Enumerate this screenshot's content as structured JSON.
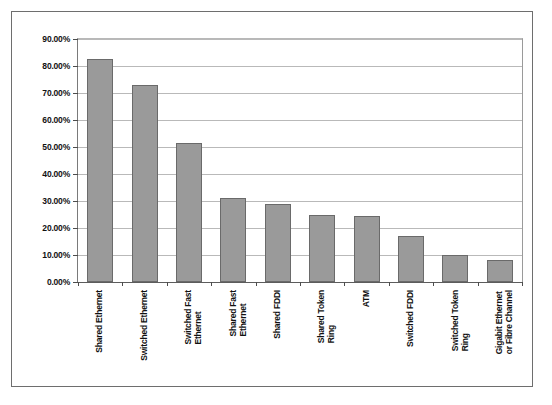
{
  "chart_data": {
    "type": "bar",
    "title": "",
    "subtitle": "",
    "xlabel": "",
    "ylabel": "",
    "ylim": [
      0,
      90
    ],
    "grid": true,
    "legend": false,
    "y_ticks": [
      "0.00%",
      "10.00%",
      "20.00%",
      "30.00%",
      "40.00%",
      "50.00%",
      "60.00%",
      "70.00%",
      "80.00%",
      "90.00%"
    ],
    "y_tick_values": [
      0,
      10,
      20,
      30,
      40,
      50,
      60,
      70,
      80,
      90
    ],
    "categories": [
      "Shared Ethernet",
      "Switched Ethernet",
      "Switched Fast Ethernet",
      "Shared Fast Ethernet",
      "Shared FDDI",
      "Shared Token Ring",
      "ATM",
      "Switched FDDI",
      "Switched Token Ring",
      "Gigabit Ethernet or Fibre Channel"
    ],
    "category_lines": [
      [
        "Shared Ethernet"
      ],
      [
        "Switched Ethernet"
      ],
      [
        "Switched Fast",
        "Ethernet"
      ],
      [
        "Shared Fast",
        "Ethernet"
      ],
      [
        "Shared FDDI"
      ],
      [
        "Shared Token",
        "Ring"
      ],
      [
        "ATM"
      ],
      [
        "Switched FDDI"
      ],
      [
        "Switched Token",
        "Ring"
      ],
      [
        "Gigabit Ethernet",
        "or Fibre Channel"
      ]
    ],
    "values": [
      82.5,
      72.8,
      51.5,
      31.3,
      29.0,
      24.8,
      24.5,
      17.0,
      10.0,
      8.2
    ],
    "value_labels": [
      "82.50%",
      "72.80%",
      "51.50%",
      "31.30%",
      "29.00%",
      "24.80%",
      "24.50%",
      "17.00%",
      "10.00%",
      "8.20%"
    ],
    "colors": {
      "bar_fill": "#9a9a9a",
      "bar_border": "#6a6a6a",
      "gridline": "#b9b9b9",
      "axis": "#4d4d4d",
      "frame": "#6e6e6e",
      "background": "#ffffff",
      "text": "#111111"
    }
  }
}
